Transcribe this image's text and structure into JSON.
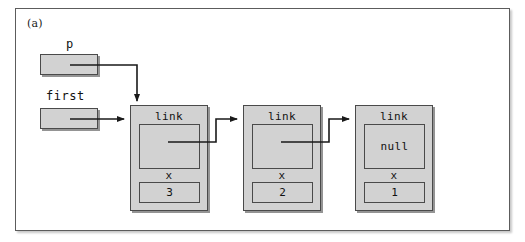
{
  "figure": {
    "panel_label": "(a)",
    "background_color": "#ffffff",
    "frame_color": "#5c5c5c",
    "box_fill_color": "#d2d2d2",
    "line_color": "#1a1a1a"
  },
  "pointers": [
    {
      "name": "p-pointer",
      "label": "p",
      "target": "node-1",
      "target_side": "top"
    },
    {
      "name": "first-pointer",
      "label": "first",
      "target": "node-1",
      "target_side": "left"
    }
  ],
  "nodes": [
    {
      "name": "node-1",
      "link_field_label": "link",
      "link_field_value": "",
      "data_field_label": "x",
      "data_field_value": "3",
      "points_to": "node-2"
    },
    {
      "name": "node-2",
      "link_field_label": "link",
      "link_field_value": "",
      "data_field_label": "x",
      "data_field_value": "2",
      "points_to": "node-3"
    },
    {
      "name": "node-3",
      "link_field_label": "link",
      "link_field_value": "null",
      "data_field_label": "x",
      "data_field_value": "1",
      "points_to": ""
    }
  ]
}
